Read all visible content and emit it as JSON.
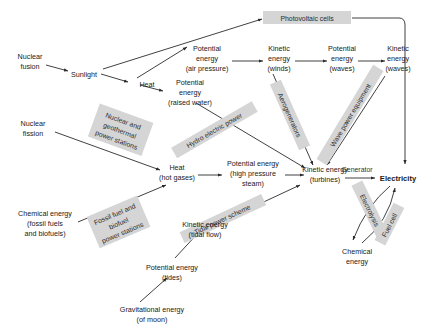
{
  "diagram": {
    "background": "#ffffff",
    "line_color": "#2b2b2b",
    "box_fill": "#d5d5d5",
    "nodes": {
      "nuclear_fusion": "Nuclear\nfusion",
      "nuclear_fusion_l1": "Nuclear",
      "nuclear_fusion_l2": "fusion",
      "sunlight": "Sunlight",
      "heat": "Heat",
      "pe_raised_water_l1": "Potential",
      "pe_raised_water_l2": "energy",
      "pe_raised_water_l3": "(raised water)",
      "pe_air_pressure_l1": "Potential",
      "pe_air_pressure_l2": "energy",
      "pe_air_pressure_l3": "(air pressure)",
      "ke_winds_l1": "Kinetic",
      "ke_winds_l2": "energy",
      "ke_winds_l3": "(winds)",
      "pe_waves_l1": "Potential",
      "pe_waves_l2": "energy",
      "pe_waves_l3": "(waves)",
      "ke_waves_l1": "Kinetic",
      "ke_waves_l2": "energy",
      "ke_waves_l3": "(waves)",
      "nuclear_fission_l1": "Nuclear",
      "nuclear_fission_l2": "fission",
      "heat_hot_gases_l1": "Heat",
      "heat_hot_gases_l2": "(hot gases)",
      "pe_steam_l1": "Potential energy",
      "pe_steam_l2": "(high pressure",
      "pe_steam_l3": "steam)",
      "ke_turbines_l1": "Kinetic energy",
      "ke_turbines_l2": "(turbines)",
      "electricity": "Electricity",
      "chemical_energy_out_l1": "Chemical",
      "chemical_energy_out_l2": "energy",
      "chemical_fuels_l1": "Chemical energy",
      "chemical_fuels_l2": "(fossil fuels",
      "chemical_fuels_l3": "and biofuels)",
      "ke_tidal_l1": "Kinetic energy",
      "ke_tidal_l2": "(tidal flow)",
      "pe_tides_l1": "Potential energy",
      "pe_tides_l2": "(tides)",
      "gravitational_l1": "Gravitational energy",
      "gravitational_l2": "(of moon)"
    },
    "process_labels": {
      "photovoltaic_cells": "Photovoltaic cells",
      "aerogenerators": "Aerogenerators",
      "wave_power_equipment": "Wave power equipment",
      "hydro_electric_power": "Hydro electric power",
      "nuclear_geothermal_l1": "Nuclear and",
      "nuclear_geothermal_l2": "geothermal",
      "nuclear_geothermal_l3": "power stations",
      "fossil_biofuel_l1": "Fossil fuel and",
      "fossil_biofuel_l2": "biofuel",
      "fossil_biofuel_l3": "power stations",
      "tidal_power_scheme": "Tidal power scheme",
      "generator": "Generator",
      "electrolysis": "Electrolysis",
      "fuel_cell": "Fuel cell"
    }
  }
}
